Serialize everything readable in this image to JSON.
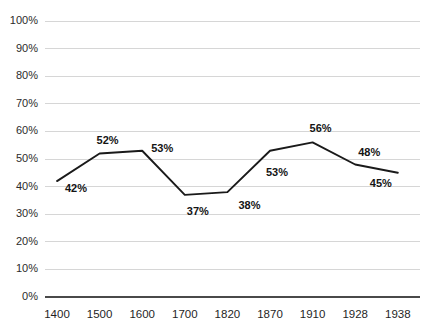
{
  "chart_data": {
    "type": "line",
    "title": "",
    "subtitle": "",
    "xlabel": "",
    "ylabel": "",
    "categories": [
      "1400",
      "1500",
      "1600",
      "1700",
      "1820",
      "1870",
      "1910",
      "1928",
      "1938"
    ],
    "values": [
      42,
      52,
      53,
      37,
      38,
      53,
      56,
      48,
      45
    ],
    "data_labels": [
      "42%",
      "52%",
      "53%",
      "37%",
      "38%",
      "53%",
      "56%",
      "48%",
      "45%"
    ],
    "ylim": [
      0,
      100
    ],
    "y_tick_values": [
      0,
      10,
      20,
      30,
      40,
      50,
      60,
      70,
      80,
      90,
      100
    ],
    "y_tick_labels": [
      "0%",
      "10%",
      "20%",
      "30%",
      "40%",
      "50%",
      "60%",
      "70%",
      "80%",
      "90%",
      "100%"
    ],
    "grid": true,
    "grid_axis": "y",
    "legend": false,
    "legend_position": "none",
    "series": [
      {
        "name": "",
        "values": [
          42,
          52,
          53,
          37,
          38,
          53,
          56,
          48,
          45
        ]
      }
    ],
    "colors": {
      "line": "#1a1a1a",
      "gridline": "#d6d6d6",
      "axis": "#4a4a4a",
      "label_text": "#141414",
      "tick_text": "#2b2b2b",
      "background": "#ffffff"
    },
    "label_offsets": [
      {
        "dx": 8,
        "dy": 11
      },
      {
        "dx": -3,
        "dy": -9
      },
      {
        "dx": 9,
        "dy": 1
      },
      {
        "dx": 2,
        "dy": 20
      },
      {
        "dx": 11,
        "dy": 17
      },
      {
        "dx": -4,
        "dy": 25
      },
      {
        "dx": -3,
        "dy": -10
      },
      {
        "dx": 3,
        "dy": -9
      },
      {
        "dx": -28,
        "dy": 14
      }
    ]
  },
  "plot_geometry": {
    "left": 45,
    "right": 420,
    "top": 21,
    "bottom": 297,
    "first_point_x": 57,
    "point_spacing": 42.6,
    "x_axis_label_y": 318
  }
}
